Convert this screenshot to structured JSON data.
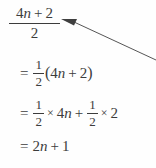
{
  "document": {
    "type": "math-worked-solution",
    "background_color": "#fefefe",
    "ink_color": "#3c3c3c"
  },
  "headline": {
    "label": "fraction-4n-plus-2-over-2",
    "numerator": {
      "coefficient": "4",
      "variable": "n",
      "operator": "+",
      "constant": "2"
    },
    "denominator": "2"
  },
  "annotation": {
    "arrow": {
      "name": "pointer-arrow",
      "color": "#4a4a4a",
      "points_to": "headline-fraction",
      "tail_x": 156,
      "tail_y": 60,
      "head_x": 62,
      "head_y": 20
    }
  },
  "steps": [
    {
      "id": "step-1",
      "equals": "=",
      "fraction": {
        "numerator": "1",
        "denominator": "2"
      },
      "open_paren": "(",
      "coefficient": "4",
      "variable": "n",
      "operator": "+",
      "constant": "2",
      "close_paren": ")",
      "plain_text": "= 1/2(4n + 2)"
    },
    {
      "id": "step-2",
      "equals": "=",
      "fraction_left": {
        "numerator": "1",
        "denominator": "2"
      },
      "times_left": "×",
      "term_left_coefficient": "4",
      "term_left_variable": "n",
      "operator": "+",
      "fraction_right": {
        "numerator": "1",
        "denominator": "2"
      },
      "times_right": "×",
      "term_right": "2",
      "plain_text": "= 1/2 × 4n + 1/2 × 2"
    },
    {
      "id": "step-3",
      "equals": "=",
      "coefficient": "2",
      "variable": "n",
      "operator": "+",
      "constant": "1",
      "plain_text": "= 2n + 1"
    }
  ]
}
